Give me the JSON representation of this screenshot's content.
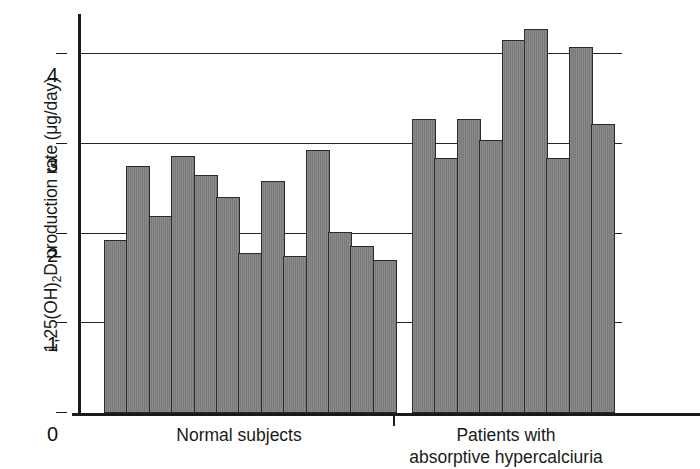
{
  "chart_data": {
    "type": "bar",
    "title": "",
    "subtitle": "",
    "xlabel": "",
    "ylabel": "1,25(OH)2D production rate (μg/day)",
    "ylabel_parts": {
      "before": "1,25(OH)",
      "sub": "2",
      "after": "D production rate (μg/day)"
    },
    "ylim": [
      0,
      4.45
    ],
    "yticks": [
      0,
      1,
      2,
      3,
      4
    ],
    "ytick_labels": [
      "0",
      "1",
      "2",
      "3",
      "4"
    ],
    "grid": "horizontal",
    "legend": "none",
    "bar_color": "#7d7d7d",
    "bar_edge_color": "#2b2b2b",
    "axis_color": "#1a1a1a",
    "categories": [
      "Normal subjects",
      "Patients with absorptive hypercalciuria"
    ],
    "groups": [
      {
        "name": "Normal subjects",
        "label_lines": [
          "Normal subjects"
        ],
        "values": [
          1.93,
          2.76,
          2.2,
          2.87,
          2.66,
          2.41,
          1.79,
          2.59,
          1.75,
          2.93,
          2.02,
          1.86,
          1.71
        ]
      },
      {
        "name": "Patients with absorptive hypercalciuria",
        "label_lines": [
          "Patients with",
          "absorptive hypercalciuria"
        ],
        "values": [
          3.28,
          2.84,
          3.28,
          3.04,
          4.16,
          4.28,
          2.84,
          4.08,
          3.22
        ]
      }
    ]
  }
}
